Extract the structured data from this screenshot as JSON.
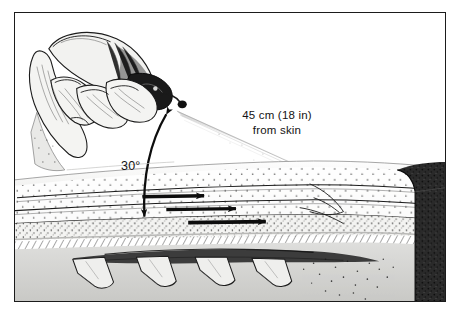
{
  "figure": {
    "style": "pen-and-ink stipple medical illustration",
    "frame": {
      "present": true,
      "color": "#1b1b1b",
      "background": "#ffffff"
    }
  },
  "labels": {
    "distance": {
      "line1": "45 cm (18 in)",
      "line2": "from skin",
      "value_metric": "45 cm",
      "value_imperial": "18 in",
      "name": "spray-distance-label"
    },
    "angle": {
      "text": "30°",
      "value": 30,
      "unit": "degrees",
      "name": "spray-angle-label"
    }
  },
  "elements": {
    "hand": {
      "name": "gloved-hand",
      "description": "hand gripping spray applicator, upper left"
    },
    "bottle": {
      "name": "spray-bottle",
      "description": "dark spray applicator bottle with nozzle"
    },
    "nozzle": {
      "name": "spray-nozzle",
      "description": "nozzle tip emitting spray"
    },
    "spray_cone": {
      "name": "spray-cone",
      "description": "fan of spray from nozzle to skin surface"
    },
    "angle_arrow": {
      "name": "angle-arc-arrow",
      "description": "double-headed curved arrow marking 30 degree angle"
    },
    "skin_surface": {
      "name": "skin-surface-line",
      "description": "gently curved epidermal surface"
    },
    "flow_arrows": {
      "name": "flow-arrow",
      "count": 3,
      "direction": "right"
    },
    "dermal_layers": {
      "name": "dermal-stipple-layers",
      "count": 3
    },
    "subcutaneous_band": {
      "name": "subcutaneous-tissue-band"
    },
    "grafts": {
      "name": "skin-graft-flap",
      "count": 4
    },
    "cut_face": {
      "name": "cross-section-cut-face",
      "description": "dark stippled block at right edge"
    }
  },
  "colors": {
    "ink": "#141414",
    "frame": "#1b1b1b",
    "paper": "#ffffff",
    "light_tissue": "#d9d9d7",
    "mid_tissue": "#b4b4b2",
    "dark_tissue": "#3a3a3a",
    "cut_face": "#2a2a2a"
  }
}
